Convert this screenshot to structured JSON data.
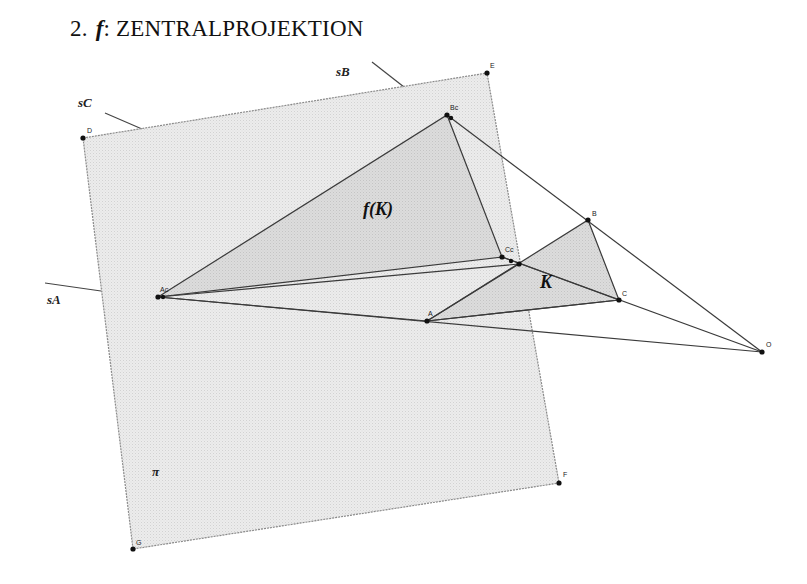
{
  "title": {
    "number": "2.",
    "function": "f",
    "separator": ":",
    "text": "ZENTRALPROJEKTION"
  },
  "diagram": {
    "plane_label": "π",
    "image_label": "f(K)",
    "object_label": "K",
    "line_labels": {
      "sA": "sA",
      "sB": "sB",
      "sC": "sC"
    },
    "points": {
      "D": "D",
      "E": "E",
      "F": "F",
      "G": "G",
      "A": "A",
      "B": "B",
      "C": "C",
      "O": "O",
      "Ac": "Ac",
      "Bc": "Bc",
      "Cc": "Cc"
    },
    "colors": {
      "plane_fill": "#e9e9e9",
      "plane_edge": "#8a8a8a",
      "triangle_fill": "#d8d8d8",
      "line": "#3a3a3a",
      "point": "#111111"
    }
  }
}
